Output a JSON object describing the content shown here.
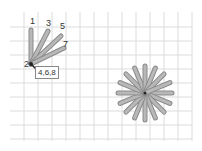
{
  "grid": {
    "spacing": 14,
    "x0": 10,
    "y0": 12,
    "x1": 192,
    "y1": 141,
    "color": "#dcdcdc"
  },
  "fan": {
    "origin": [
      31,
      64
    ],
    "rays": [
      {
        "label": "1",
        "end": [
          31,
          30
        ]
      },
      {
        "label": "3",
        "end": [
          48,
          31
        ]
      },
      {
        "label": "5",
        "end": [
          61,
          36
        ]
      },
      {
        "label": "7",
        "end": [
          64,
          48
        ]
      }
    ],
    "labels": [
      {
        "text": "1",
        "x": 30,
        "y": 17
      },
      {
        "text": "3",
        "x": 46,
        "y": 19
      },
      {
        "text": "5",
        "x": 60,
        "y": 22
      },
      {
        "text": "7",
        "x": 63,
        "y": 40
      },
      {
        "text": "2",
        "x": 24,
        "y": 60
      }
    ],
    "box_label": "4,6,8"
  },
  "starburst": {
    "center": [
      145,
      93
    ],
    "radius": 27,
    "rays": 16
  },
  "colors": {
    "ray_fill": "#b8b8b8",
    "ray_stroke": "#8a8a8a",
    "center": "#222222"
  }
}
